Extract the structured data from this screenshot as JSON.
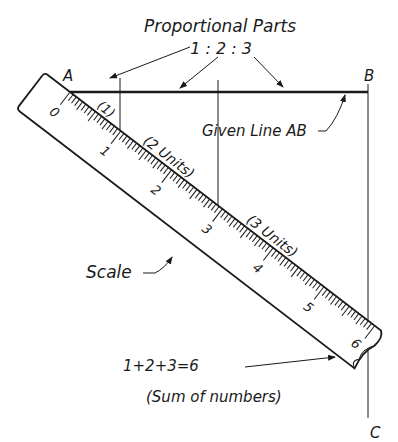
{
  "title": "Proportional Parts",
  "ratio": "1 : 2 : 3",
  "points": {
    "a": "A",
    "b": "B",
    "c": "C"
  },
  "labels": {
    "given_line": "Given Line AB",
    "scale": "Scale",
    "part1": "(1)",
    "part2": "(2 Units)",
    "part3": "(3 Units)",
    "sum_equation": "1+2+3=6",
    "sum_note": "(Sum of numbers)"
  },
  "scale_numbers": [
    "0",
    "1",
    "2",
    "3",
    "4",
    "5",
    "6"
  ],
  "colors": {
    "ink": "#1a1a1a",
    "paper": "#ffffff"
  }
}
